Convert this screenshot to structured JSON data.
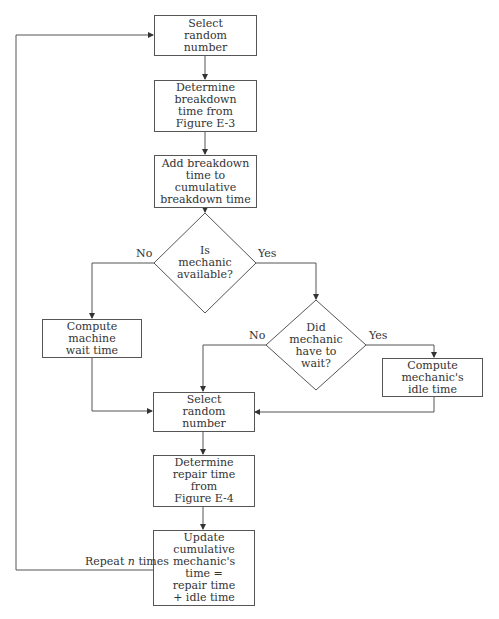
{
  "flowchart": {
    "nodes": {
      "select_random_1": "Select\nrandom\nnumber",
      "determine_breakdown": "Determine\nbreakdown\ntime from\nFigure E-3",
      "add_breakdown": "Add breakdown\ntime to\ncumulative\nbreakdown time",
      "is_mechanic_available": "Is\nmechanic\navailable?",
      "compute_machine_wait": "Compute\nmachine\nwait time",
      "did_mechanic_wait": "Did\nmechanic\nhave to\nwait?",
      "compute_idle": "Compute\nmechanic's\nidle time",
      "select_random_2": "Select\nrandom\nnumber",
      "determine_repair": "Determine\nrepair time\nfrom\nFigure E-4",
      "update_cumulative": "Update\ncumulative\nmechanic's\ntime =\nrepair time\n+ idle time"
    },
    "labels": {
      "d1_no": "No",
      "d1_yes": "Yes",
      "d2_no": "No",
      "d2_yes": "Yes",
      "repeat_prefix": "Repeat ",
      "repeat_n": "n",
      "repeat_suffix": " times"
    },
    "colors": {
      "line": "#555555",
      "text": "#333333"
    }
  }
}
